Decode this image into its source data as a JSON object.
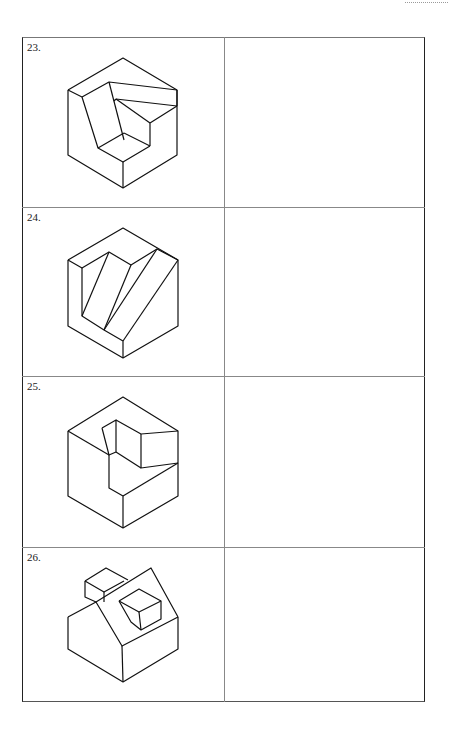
{
  "page": {
    "rows": [
      {
        "number": "23.",
        "figure": "isometric-figure-23"
      },
      {
        "number": "24.",
        "figure": "isometric-figure-24"
      },
      {
        "number": "25.",
        "figure": "isometric-figure-25"
      },
      {
        "number": "26.",
        "figure": "isometric-figure-26"
      }
    ],
    "answer_cells": [
      "",
      "",
      "",
      ""
    ]
  }
}
